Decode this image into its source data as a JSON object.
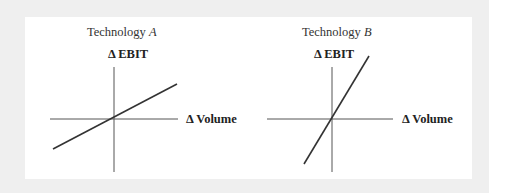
{
  "panels": [
    {
      "id": "technology-a",
      "title_prefix": "Technology ",
      "title_letter": "A",
      "y_axis_label": "Δ EBIT",
      "x_axis_label": "Δ Volume",
      "slope_description": "shallow positive slope through origin"
    },
    {
      "id": "technology-b",
      "title_prefix": "Technology ",
      "title_letter": "B",
      "y_axis_label": "Δ EBIT",
      "x_axis_label": "Δ Volume",
      "slope_description": "steep positive slope through origin"
    }
  ],
  "colors": {
    "outer_background": "#efefef",
    "inner_background": "#ffffff",
    "axis": "#555555",
    "line": "#333333",
    "text": "#222222"
  }
}
